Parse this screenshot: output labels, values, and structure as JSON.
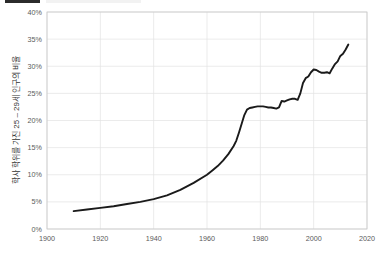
{
  "header": {
    "highlight_color": "#2b2b2b",
    "ghost_color": "#f2f2f2",
    "cropped_note": ""
  },
  "colors": {
    "line": "#1a1a1a",
    "grid": "#e2e2e2",
    "frame": "#c8c8c8",
    "tick_label": "#5a5a5a",
    "axis_title": "#333333",
    "background": "#ffffff"
  },
  "chart_data": {
    "type": "line",
    "title": "",
    "xlabel": "",
    "ylabel": "학사 학위를 가진 25 – 29세 인구의 비율",
    "xlim": [
      1900,
      2020
    ],
    "ylim": [
      0,
      40
    ],
    "grid": true,
    "legend": "none",
    "xticks": [
      1900,
      1920,
      1940,
      1960,
      1980,
      2000,
      2020
    ],
    "xticklabels": [
      "1900",
      "1920",
      "1940",
      "1960",
      "1980",
      "2000",
      "2020"
    ],
    "yticks": [
      0,
      5,
      10,
      15,
      20,
      25,
      30,
      35,
      40
    ],
    "yticklabels": [
      "0%",
      "5%",
      "10%",
      "15%",
      "20%",
      "25%",
      "30%",
      "35%",
      "40%"
    ],
    "series": [
      {
        "name": "학사 학위를 가진 25 – 29세 인구의 비율",
        "x": [
          1910,
          1915,
          1920,
          1925,
          1930,
          1935,
          1940,
          1945,
          1950,
          1955,
          1960,
          1962,
          1964,
          1966,
          1968,
          1970,
          1971,
          1972,
          1973,
          1974,
          1975,
          1976,
          1977,
          1978,
          1979,
          1980,
          1981,
          1982,
          1983,
          1984,
          1985,
          1986,
          1987,
          1988,
          1989,
          1990,
          1991,
          1992,
          1993,
          1994,
          1995,
          1996,
          1997,
          1998,
          1999,
          2000,
          2001,
          2002,
          2003,
          2004,
          2005,
          2006,
          2007,
          2008,
          2009,
          2010,
          2011,
          2012,
          2013
        ],
        "y": [
          3.3,
          3.6,
          3.9,
          4.2,
          4.6,
          5.0,
          5.5,
          6.2,
          7.2,
          8.5,
          10.0,
          10.8,
          11.6,
          12.6,
          13.8,
          15.3,
          16.3,
          17.8,
          19.4,
          21.0,
          22.0,
          22.3,
          22.4,
          22.5,
          22.6,
          22.6,
          22.6,
          22.5,
          22.4,
          22.4,
          22.3,
          22.2,
          22.4,
          23.6,
          23.5,
          23.7,
          23.9,
          24.0,
          24.0,
          23.8,
          25.0,
          26.9,
          27.8,
          28.1,
          28.9,
          29.4,
          29.3,
          29.0,
          28.8,
          28.8,
          28.9,
          28.7,
          29.6,
          30.4,
          30.9,
          31.9,
          32.3,
          33.1,
          34.0
        ]
      }
    ]
  }
}
